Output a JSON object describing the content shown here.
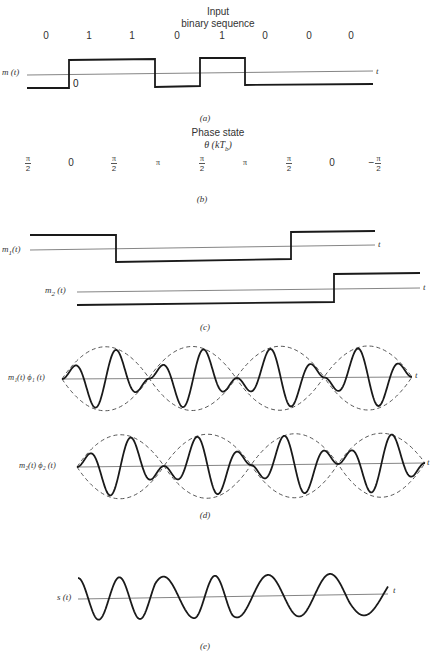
{
  "figure": {
    "panel_a": {
      "title_line1": "Input",
      "title_line2": "binary sequence",
      "bits": [
        "0",
        "1",
        "1",
        "0",
        "1",
        "0",
        "0",
        "0"
      ],
      "signal_label": "m (t)",
      "axis_label": "t",
      "origin_label": "0",
      "caption": "(a)"
    },
    "panel_b": {
      "title_line1": "Phase state",
      "title_line2": "θ (kT",
      "title_sub": "b",
      "title_close": ")",
      "phases": [
        {
          "type": "frac",
          "sign": "",
          "num": "π",
          "den": "2"
        },
        {
          "type": "plain",
          "text": "0"
        },
        {
          "type": "frac",
          "sign": "",
          "num": "π",
          "den": "2"
        },
        {
          "type": "plain",
          "text": "π"
        },
        {
          "type": "frac",
          "sign": "",
          "num": "π",
          "den": "2"
        },
        {
          "type": "plain",
          "text": "π"
        },
        {
          "type": "frac",
          "sign": "",
          "num": "π",
          "den": "2"
        },
        {
          "type": "plain",
          "text": "0"
        },
        {
          "type": "frac",
          "sign": "−",
          "num": "π",
          "den": "2"
        }
      ],
      "caption": "(b)"
    },
    "panel_c": {
      "m1_label": "m",
      "m1_sub": "1",
      "m1_suffix": "(t)",
      "m2_label": "m",
      "m2_sub": "2",
      "m2_suffix": " (t)",
      "axis_label": "t",
      "caption": "(c)"
    },
    "panel_d": {
      "row1_label": "m₁(t) ϕ₁ (t)",
      "row2_label": "m₂(t) ϕ₂ (t)",
      "axis_label": "t",
      "caption": "(d)"
    },
    "panel_e": {
      "signal_label": "s (t)",
      "axis_label": "t",
      "caption": "(e)"
    }
  },
  "colors": {
    "signal": "#1a1a1a",
    "axis": "#555555",
    "envelope": "#444444",
    "text": "#333333"
  }
}
